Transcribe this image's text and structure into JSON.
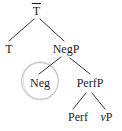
{
  "diagram": {
    "type": "syntax-tree",
    "nodes": {
      "tbar": {
        "label": "T",
        "has_overline": true
      },
      "t": {
        "label": "T"
      },
      "negp": {
        "label": "NegP"
      },
      "neg": {
        "label": "Neg",
        "circled": true
      },
      "perfp": {
        "label": "PerfP"
      },
      "perf": {
        "label": "Perf"
      },
      "vp": {
        "label_italic": "v",
        "label_rest": "P"
      }
    },
    "edges": [
      {
        "from": "tbar",
        "to": "t"
      },
      {
        "from": "tbar",
        "to": "negp"
      },
      {
        "from": "negp",
        "to": "neg"
      },
      {
        "from": "negp",
        "to": "perfp"
      },
      {
        "from": "perfp",
        "to": "perf"
      },
      {
        "from": "perfp",
        "to": "vp"
      }
    ],
    "colors": {
      "text": "#1c1c1c",
      "line": "#333333",
      "circle_highlight": "#c9c9c9",
      "background": "#ffffff"
    }
  }
}
